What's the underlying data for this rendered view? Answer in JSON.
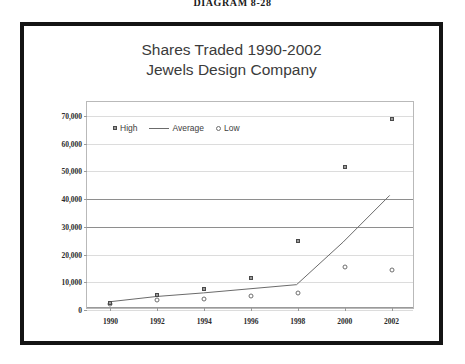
{
  "figure": {
    "caption": "DIAGRAM 8-28"
  },
  "chart_data": {
    "type": "scatter",
    "title": "Shares Traded 1990-2002",
    "subtitle": "Jewels Design Company",
    "xlabel": "",
    "ylabel": "",
    "categories": [
      "1990",
      "1992",
      "1994",
      "1996",
      "1998",
      "2000",
      "2002"
    ],
    "x": [
      1990,
      1992,
      1994,
      1996,
      1998,
      2000,
      2002
    ],
    "xlim": [
      1989,
      2003
    ],
    "ylim": [
      0,
      75000
    ],
    "yticks": [
      0,
      10000,
      20000,
      30000,
      40000,
      50000,
      60000,
      70000
    ],
    "ytick_labels": [
      "0",
      "10,000",
      "20,000",
      "30,000",
      "40,000",
      "50,000",
      "60,000",
      "70,000"
    ],
    "grid": true,
    "legend_position": "upper-left-inside",
    "series": [
      {
        "name": "High",
        "marker": "filled-square",
        "values": [
          2500,
          5500,
          7500,
          11500,
          25000,
          51500,
          69000
        ]
      },
      {
        "name": "Average",
        "marker": "line",
        "values": [
          2300,
          4200,
          5500,
          7000,
          8500,
          24000,
          41000
        ]
      },
      {
        "name": "Low",
        "marker": "open-circle",
        "values": [
          2200,
          3500,
          4000,
          5000,
          6000,
          15500,
          14500
        ]
      }
    ]
  },
  "legend": {
    "items": [
      {
        "label": "High"
      },
      {
        "label": "Average"
      },
      {
        "label": "Low"
      }
    ]
  },
  "colors": {
    "frame": "#141414",
    "plot_border": "#b9b9b9",
    "gridline": "#dcdcdc",
    "gridline_major": "#8e8e8e",
    "marker_high": "#9b9b9b",
    "marker_low": "#ffffff",
    "average_line": "#6b6b6b",
    "title_text": "#3b3b3b",
    "tick_text": "#2b2b2b"
  }
}
